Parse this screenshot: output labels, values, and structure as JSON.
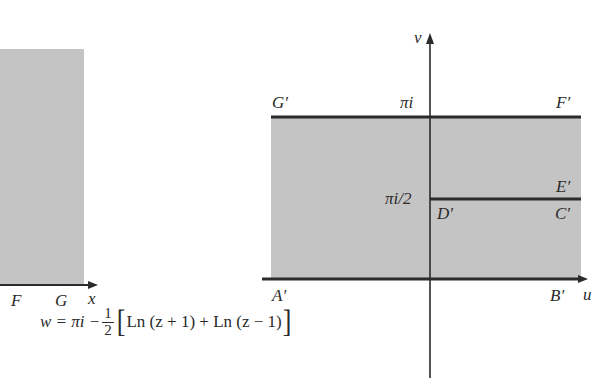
{
  "left_panel": {
    "region": "z-plane shaded region (partially visible)",
    "x_axis_label": "x",
    "points": [
      {
        "name": "F",
        "label": "F"
      },
      {
        "name": "G",
        "label": "G"
      }
    ]
  },
  "right_panel": {
    "region": "w-plane shaded strip",
    "u_axis_label": "u",
    "v_axis_label": "v",
    "ticks": {
      "pi_i": "πi",
      "pi_i_half": "πi/2"
    },
    "points": [
      {
        "name": "G-prime",
        "label": "G′"
      },
      {
        "name": "F-prime",
        "label": "F′"
      },
      {
        "name": "E-prime",
        "label": "E′"
      },
      {
        "name": "D-prime",
        "label": "D′"
      },
      {
        "name": "C-prime",
        "label": "C′"
      },
      {
        "name": "A-prime",
        "label": "A′"
      },
      {
        "name": "B-prime",
        "label": "B′"
      }
    ]
  },
  "formula": {
    "lhs": "w = πi −",
    "frac_num": "1",
    "frac_den": "2",
    "open_bracket": "[",
    "body": "Ln (z + 1) + Ln (z − 1)",
    "close_bracket": "]"
  },
  "colors": {
    "shade": "#c4c4c4",
    "line": "#2b2b2b",
    "background": "#ffffff"
  }
}
